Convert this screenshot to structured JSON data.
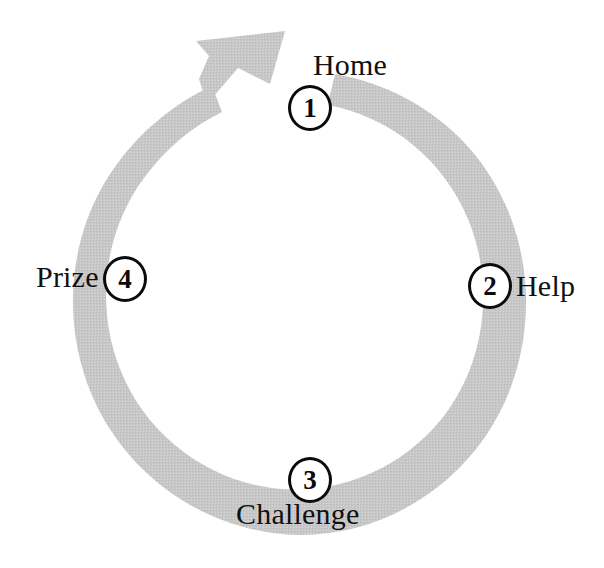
{
  "diagram": {
    "type": "cyclical-process-arrow",
    "title": "",
    "direction": "clockwise",
    "band_color": "#c6c6c6",
    "node_color": "#0b0b0b",
    "background": "#ffffff",
    "center": {
      "x": 303,
      "y": 288
    },
    "radius": 186,
    "steps": [
      {
        "number": "1",
        "label": "Home",
        "angle_deg": -90,
        "label_position": "right"
      },
      {
        "number": "2",
        "label": "Help",
        "angle_deg": 0,
        "label_position": "right"
      },
      {
        "number": "3",
        "label": "Challenge",
        "angle_deg": 90,
        "label_position": "below"
      },
      {
        "number": "4",
        "label": "Prize",
        "angle_deg": 180,
        "label_position": "left"
      }
    ],
    "arrow": {
      "head_tip": {
        "x": 278,
        "y": 34
      },
      "tail_start_angle_deg": -78,
      "taper": "thin at step 1, thickest at arrowhead"
    }
  }
}
